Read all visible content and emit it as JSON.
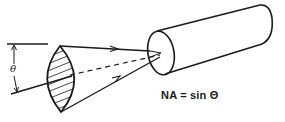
{
  "diagram": {
    "angle_label": "θ",
    "formula": "NA = sin Θ",
    "elements": [
      "reference-line",
      "angle-dimension-arrow",
      "acceptance-cone-lens-hatched",
      "upper-ray-with-arrow",
      "lower-ray-with-arrow",
      "dashed-axis",
      "fiber-cylinder"
    ],
    "colors": {
      "stroke": "#1a1a1a",
      "background": "#ffffff"
    }
  }
}
